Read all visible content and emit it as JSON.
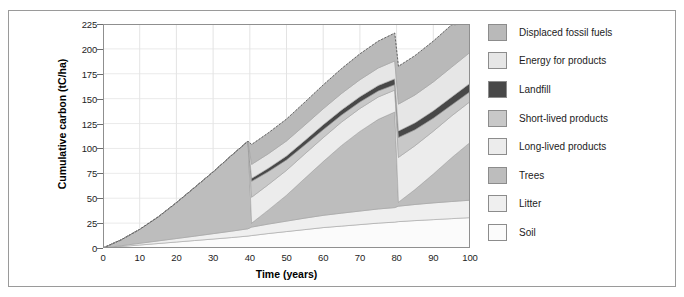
{
  "chart_data": {
    "type": "area",
    "title": "",
    "xlabel": "Time (years)",
    "ylabel": "Cumulative carbon (tC/ha)",
    "xlim": [
      0,
      100
    ],
    "ylim": [
      0,
      225
    ],
    "xticks": [
      0,
      10,
      20,
      30,
      40,
      50,
      60,
      70,
      80,
      90,
      100
    ],
    "yticks": [
      0,
      25,
      50,
      75,
      100,
      125,
      150,
      175,
      200,
      225
    ],
    "grid": true,
    "legend_position": "right",
    "stacked": true,
    "stack_order_bottom_to_top": [
      "Soil",
      "Litter",
      "Trees",
      "Long-lived products",
      "Short-lived products",
      "Landfill",
      "Energy for products",
      "Displaced fossil fuels"
    ],
    "x": [
      0,
      5,
      10,
      15,
      20,
      25,
      30,
      35,
      39.5,
      40.5,
      45,
      50,
      55,
      60,
      65,
      70,
      75,
      79.5,
      80.5,
      85,
      90,
      95,
      100
    ],
    "series": [
      {
        "name": "Soil",
        "color": "#fbfbfb",
        "values": [
          0,
          1.5,
          3,
          4.5,
          6,
          7.5,
          9,
          10.5,
          12,
          12.5,
          14.5,
          16.5,
          18.5,
          20.5,
          22,
          23.5,
          25,
          26,
          26.5,
          27.5,
          28.5,
          29.5,
          30.5
        ]
      },
      {
        "name": "Litter",
        "color": "#efefef",
        "values": [
          0,
          0.8,
          1.7,
          2.6,
          3.5,
          4.4,
          5.4,
          6.4,
          7.3,
          8.5,
          9.5,
          10.5,
          11.5,
          12.3,
          13,
          13.6,
          14.2,
          14.6,
          15.5,
          16.2,
          16.8,
          17.2,
          17.5
        ]
      },
      {
        "name": "Trees",
        "color": "#bdbdbd",
        "values": [
          0,
          6,
          14,
          24,
          36,
          49,
          62,
          76,
          88,
          4,
          14,
          26,
          40,
          54,
          68,
          80,
          90,
          96,
          4,
          15,
          29,
          44,
          58
        ]
      },
      {
        "name": "Long-lived products",
        "color": "#ececec",
        "values": [
          0,
          0,
          0,
          0,
          0,
          0,
          0,
          0,
          0,
          26,
          25.5,
          25,
          24.5,
          24,
          23.5,
          23,
          22.5,
          22,
          45,
          44,
          43,
          42,
          41
        ]
      },
      {
        "name": "Short-lived products",
        "color": "#c8c8c8",
        "values": [
          0,
          0,
          0,
          0,
          0,
          0,
          0,
          0,
          0,
          16,
          13,
          10.5,
          9,
          8,
          7,
          6.5,
          6,
          5.5,
          20,
          16,
          13,
          11,
          10
        ]
      },
      {
        "name": "Landfill",
        "color": "#484848",
        "values": [
          0,
          0,
          0,
          0,
          0,
          0,
          0,
          0,
          0,
          3,
          3.5,
          4,
          4.5,
          5,
          5.2,
          5.4,
          5.6,
          5.8,
          6.5,
          7,
          7.5,
          8,
          8.5
        ]
      },
      {
        "name": "Energy for products",
        "color": "#e6e6e6",
        "values": [
          0,
          0,
          0,
          0,
          0,
          0,
          0,
          0,
          0,
          14,
          14.5,
          15,
          15.5,
          16,
          16.5,
          17,
          17.5,
          18,
          27,
          28,
          29,
          30,
          31
        ]
      },
      {
        "name": "Displaced fossil fuels",
        "color": "#b9b9b9",
        "values": [
          0,
          0,
          0,
          0,
          0,
          0,
          0,
          0,
          0,
          20,
          21,
          22,
          23,
          24,
          25,
          26,
          27,
          28,
          38,
          39.5,
          41,
          42.5,
          44
        ]
      }
    ],
    "total_top_line": {
      "description": "dashed outline of cumulative total",
      "values": [
        0,
        8.3,
        18.7,
        31.1,
        45.5,
        60.9,
        76.4,
        92.9,
        107.3,
        108,
        115.5,
        129.5,
        148,
        163.3,
        180.2,
        194,
        205.8,
        216,
        182.5,
        193.2,
        207.8,
        224.2,
        240.5
      ]
    }
  },
  "legend": {
    "items": [
      {
        "label": "Displaced fossil fuels",
        "color": "#b9b9b9"
      },
      {
        "label": "Energy for products",
        "color": "#e6e6e6"
      },
      {
        "label": "Landfill",
        "color": "#484848"
      },
      {
        "label": "Short-lived products",
        "color": "#c8c8c8"
      },
      {
        "label": "Long-lived products",
        "color": "#ececec"
      },
      {
        "label": "Trees",
        "color": "#bdbdbd"
      },
      {
        "label": "Litter",
        "color": "#efefef"
      },
      {
        "label": "Soil",
        "color": "#fbfbfb"
      }
    ]
  }
}
